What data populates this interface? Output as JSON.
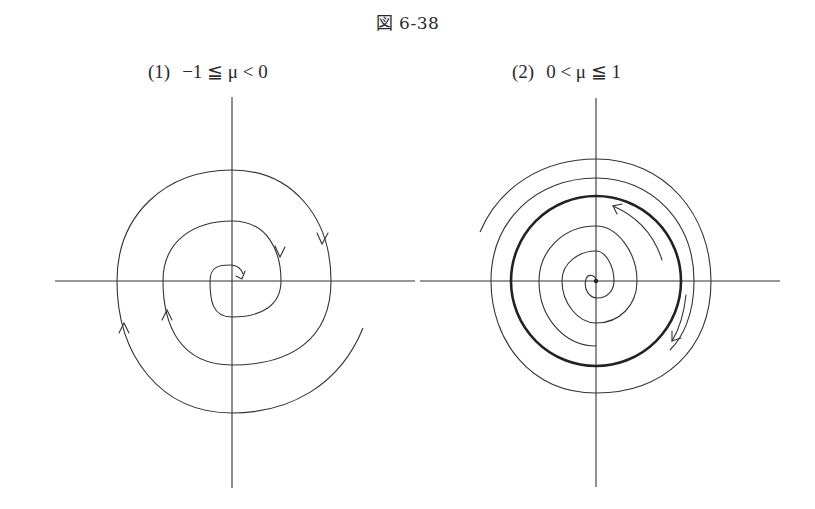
{
  "figure": {
    "title": "図 6-38"
  },
  "panels": [
    {
      "id": "1",
      "label_number": "(1)",
      "label_condition": "−1 ≦ μ < 0",
      "description": "stable spiral: trajectories spiral inward toward origin (clockwise)"
    },
    {
      "id": "2",
      "label_number": "(2)",
      "label_condition": "0 < μ ≦ 1",
      "description": "stable limit cycle (thick circle): inner trajectories spiral outward, outer trajectories spiral inward"
    }
  ]
}
